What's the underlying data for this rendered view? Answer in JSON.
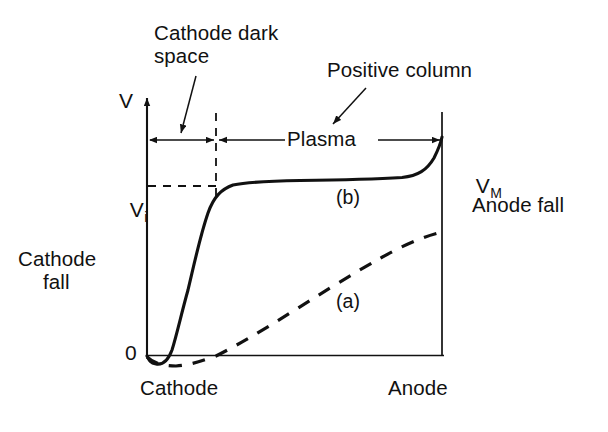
{
  "figure": {
    "type": "annotated-line-diagram",
    "background_color": "#ffffff",
    "ink_color": "#111111"
  },
  "axes": {
    "y_axis_label": "V",
    "origin_label": "0",
    "x_left_label": "Cathode",
    "x_right_label": "Anode",
    "y_tick_label": "V",
    "y_tick_sub": "i",
    "y_max_label": "V",
    "y_max_sub": "M"
  },
  "annotations": {
    "cathode_dark_space_line1": "Cathode dark",
    "cathode_dark_space_line2": "space",
    "positive_column": "Positive column",
    "plasma": "Plasma",
    "cathode_fall_line1": "Cathode",
    "cathode_fall_line2": "fall",
    "anode_fall": "Anode fall"
  },
  "curves": [
    {
      "id": "a",
      "label": "(a)",
      "style": "dashed",
      "description": "Potential without space charge: dips slightly negative at the cathode then rises almost linearly to the anode",
      "points": [
        [
          147,
          357
        ],
        [
          160,
          364
        ],
        [
          175,
          366
        ],
        [
          195,
          363
        ],
        [
          215,
          357
        ],
        [
          245,
          340
        ],
        [
          280,
          318
        ],
        [
          315,
          295
        ],
        [
          350,
          272
        ],
        [
          385,
          252
        ],
        [
          415,
          240
        ],
        [
          442,
          232
        ]
      ]
    },
    {
      "id": "b",
      "label": "(b)",
      "style": "solid",
      "description": "Potential with space charge: steep cathode fall, plateau through the plasma, small anode fall at the anode",
      "points": [
        [
          147,
          356
        ],
        [
          152,
          362
        ],
        [
          160,
          364
        ],
        [
          168,
          358
        ],
        [
          174,
          344
        ],
        [
          180,
          322
        ],
        [
          188,
          290
        ],
        [
          196,
          255
        ],
        [
          204,
          222
        ],
        [
          212,
          200
        ],
        [
          220,
          189
        ],
        [
          232,
          184
        ],
        [
          250,
          182
        ],
        [
          280,
          181
        ],
        [
          320,
          180
        ],
        [
          360,
          179
        ],
        [
          395,
          178
        ],
        [
          415,
          176
        ],
        [
          427,
          170
        ],
        [
          435,
          158
        ],
        [
          440,
          146
        ],
        [
          442,
          138
        ]
      ]
    }
  ],
  "geometry": {
    "y_axis_x": 147,
    "baseline_y": 355,
    "anode_x": 442,
    "anode_top_y": 112,
    "dark_space_boundary_x": 216,
    "vi_level_y": 186,
    "dimension_row_y": 140
  },
  "markers": {
    "dark_space_span": {
      "from": 147,
      "to": 216
    },
    "plasma_span": {
      "from": 216,
      "to": 442
    },
    "vi_dashed_from_x": 147,
    "vi_dashed_to_x": 218
  }
}
